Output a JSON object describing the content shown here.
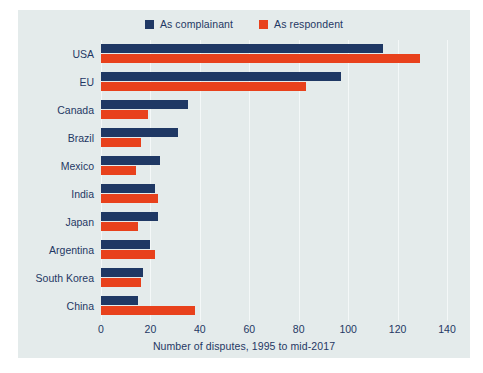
{
  "colors": {
    "complainant": "#1f3864",
    "respondent": "#e8411c",
    "panel_background": "#e4ebeb",
    "text": "#1f3864",
    "gridline": "#f4f8f8"
  },
  "legend": {
    "items": [
      {
        "label": "As complainant",
        "color": "#1f3864",
        "swatch": "square-swatch"
      },
      {
        "label": "As respondent",
        "color": "#e8411c",
        "swatch": "square-swatch"
      }
    ]
  },
  "chart_data": {
    "type": "bar",
    "orientation": "horizontal",
    "title": "",
    "subtitle": "",
    "xlabel": "Number of disputes, 1995 to mid-2017",
    "ylabel": "",
    "xlim": [
      0,
      140
    ],
    "xticks": [
      0,
      20,
      40,
      60,
      80,
      100,
      120,
      140
    ],
    "xtick_labels": [
      "0",
      "20",
      "40",
      "60",
      "80",
      "100",
      "120",
      "140"
    ],
    "grid": true,
    "legend_position": "top-center",
    "categories": [
      "USA",
      "EU",
      "Canada",
      "Brazil",
      "Mexico",
      "India",
      "Japan",
      "Argentina",
      "South Korea",
      "China"
    ],
    "series": [
      {
        "name": "As complainant",
        "color": "#1f3864",
        "values": [
          114,
          97,
          35,
          31,
          24,
          22,
          23,
          20,
          17,
          15
        ]
      },
      {
        "name": "As respondent",
        "color": "#e8411c",
        "values": [
          129,
          83,
          19,
          16,
          14,
          23,
          15,
          22,
          16,
          38
        ]
      }
    ]
  }
}
